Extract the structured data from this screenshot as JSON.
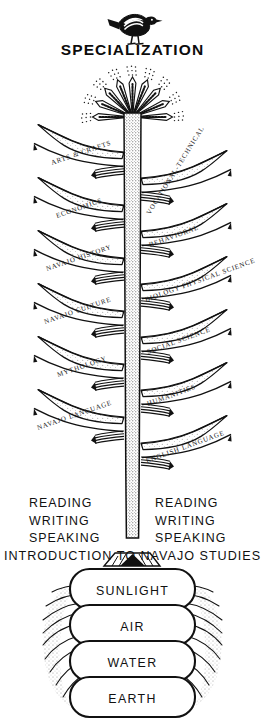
{
  "diagram": {
    "title": "SPECIALIZATION",
    "top_margin_artifact": "",
    "crown": {
      "name": "radiating-leaf-burst",
      "leaf_count": 9
    },
    "bird": {
      "name": "bird-icon",
      "species_look": "dove"
    },
    "branches_left": [
      {
        "id": "arts-crafts",
        "label": "ARTS & CRAFTS"
      },
      {
        "id": "economics",
        "label": "ECONOMICS"
      },
      {
        "id": "navajo-history",
        "label": "NAVAJO HISTORY"
      },
      {
        "id": "navajo-culture",
        "label": "NAVAJO CULTURE"
      },
      {
        "id": "mythology",
        "label": "MYTHOLOGY"
      },
      {
        "id": "navajo-language",
        "label": "NAVAJO LANGUAGE"
      }
    ],
    "branches_right": [
      {
        "id": "vocational-technical",
        "label": "VOCATIONAL-TECHNICAL"
      },
      {
        "id": "behavioral",
        "label": "BEHAVIORAL"
      },
      {
        "id": "biology-physical-science",
        "label": "BIOLOGY PHYSICAL SCIENCE"
      },
      {
        "id": "social-science",
        "label": "SOCIAL SCIENCE"
      },
      {
        "id": "humanities",
        "label": "HUMANITIES"
      },
      {
        "id": "english-language",
        "label": "ENGLISH LANGUAGE"
      }
    ],
    "skills_left": {
      "line1": "READING",
      "line2": "WRITING",
      "line3": "SPEAKING"
    },
    "skills_right": {
      "line1": "READING",
      "line2": "WRITING",
      "line3": "SPEAKING"
    },
    "foundation": "INTRODUCTION TO NAVAJO STUDIES",
    "roots": [
      {
        "id": "sunlight",
        "label": "SUNLIGHT"
      },
      {
        "id": "air",
        "label": "AIR"
      },
      {
        "id": "water",
        "label": "WATER"
      },
      {
        "id": "earth",
        "label": "EARTH"
      }
    ],
    "colors": {
      "ink": "#111111",
      "paper": "#ffffff",
      "stipple": "#4a4a4a"
    }
  }
}
